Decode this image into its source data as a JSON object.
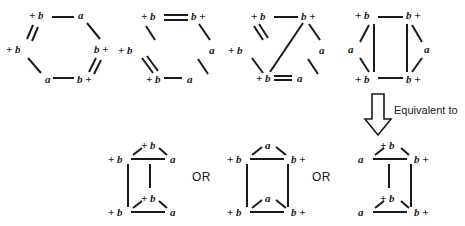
{
  "diagram": {
    "ink_color": "#1a1a1a",
    "background_color": "#ffffff",
    "labels": {
      "plus_b_left": "+ b",
      "b_plus_right": "b +",
      "a": "a",
      "or": "OR",
      "equivalent_to": "Equivalent to"
    },
    "top_row": [
      {
        "id": "hexagon-1",
        "name": "hexagon-single-bonds",
        "vertices": [
          {
            "pos": "top-left",
            "label": "+ b"
          },
          {
            "pos": "top-right",
            "label": "a"
          },
          {
            "pos": "right",
            "label": "b +"
          },
          {
            "pos": "bottom-right",
            "label": "b +"
          },
          {
            "pos": "bottom-left",
            "label": "a"
          },
          {
            "pos": "left",
            "label": "+ b"
          }
        ],
        "double_bonds": [
          "left--top-left",
          "right--bottom-right"
        ]
      },
      {
        "id": "hexagon-2",
        "name": "hexagon-double-top",
        "vertices": [
          {
            "pos": "top-left",
            "label": "+ b"
          },
          {
            "pos": "top-right",
            "label": "b +"
          },
          {
            "pos": "right",
            "label": "a"
          },
          {
            "pos": "bottom-right",
            "label": "a"
          },
          {
            "pos": "bottom-left",
            "label": "+ b"
          },
          {
            "pos": "left",
            "label": "+ b"
          }
        ],
        "double_bonds": [
          "top-left--top-right",
          "left--bottom-left"
        ]
      },
      {
        "id": "hexagon-3",
        "name": "hexagon-with-diagonal",
        "vertices": [
          {
            "pos": "top-left",
            "label": "+ b"
          },
          {
            "pos": "top-right",
            "label": "b +"
          },
          {
            "pos": "right",
            "label": "a"
          },
          {
            "pos": "bottom-right",
            "label": "a"
          },
          {
            "pos": "bottom-left",
            "label": "+ b"
          },
          {
            "pos": "left",
            "label": "+ b"
          }
        ],
        "double_bonds": [
          "left--top-left"
        ],
        "diagonal": "top-right--bottom-left"
      },
      {
        "id": "quad-4",
        "name": "quadrilateral-with-side-a",
        "vertices": [
          {
            "pos": "top-left",
            "label": "+ b"
          },
          {
            "pos": "top-right",
            "label": "b +"
          },
          {
            "pos": "left",
            "label": "a"
          },
          {
            "pos": "right",
            "label": "a"
          },
          {
            "pos": "bottom-left",
            "label": "+ b"
          },
          {
            "pos": "bottom-right",
            "label": "b +"
          }
        ]
      }
    ],
    "arrow": {
      "direction": "down",
      "caption": "Equivalent to"
    },
    "bottom_row": [
      {
        "id": "result-1",
        "name": "ladder-plusb-apex-left",
        "vertices": [
          {
            "pos": "top-apex",
            "label": "+ b"
          },
          {
            "pos": "top-left",
            "label": "+ b"
          },
          {
            "pos": "top-right",
            "label": "a"
          },
          {
            "pos": "bottom-apex",
            "label": "+ b"
          },
          {
            "pos": "bottom-left",
            "label": "+ b"
          },
          {
            "pos": "bottom-right",
            "label": "a"
          }
        ],
        "rail": "left"
      },
      {
        "id": "result-2",
        "name": "ladder-a-apex-center",
        "vertices": [
          {
            "pos": "top-apex",
            "label": "a"
          },
          {
            "pos": "top-left",
            "label": "+ b"
          },
          {
            "pos": "top-right",
            "label": "b +"
          },
          {
            "pos": "bottom-apex",
            "label": "a"
          },
          {
            "pos": "bottom-left",
            "label": "+ b"
          },
          {
            "pos": "bottom-right",
            "label": "b +"
          }
        ],
        "rail": "both"
      },
      {
        "id": "result-3",
        "name": "ladder-plusb-apex-right",
        "vertices": [
          {
            "pos": "top-apex",
            "label": "+ b"
          },
          {
            "pos": "top-left",
            "label": "a"
          },
          {
            "pos": "top-right",
            "label": "b +"
          },
          {
            "pos": "bottom-apex",
            "label": "+ b"
          },
          {
            "pos": "bottom-left",
            "label": "a"
          },
          {
            "pos": "bottom-right",
            "label": "b +"
          }
        ],
        "rail": "right"
      }
    ],
    "separators": [
      "OR",
      "OR"
    ]
  }
}
